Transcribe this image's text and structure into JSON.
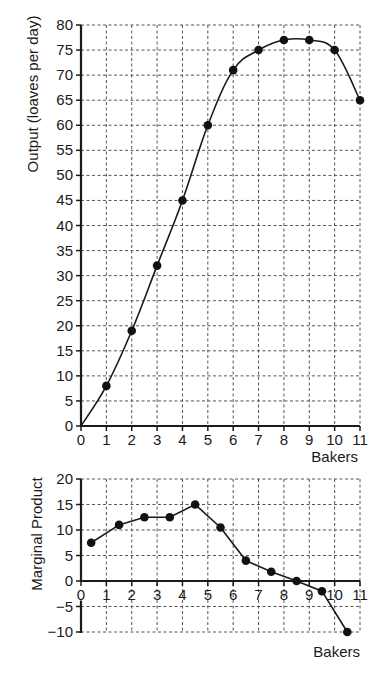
{
  "chart_data": [
    {
      "id": "total",
      "type": "line",
      "title": "",
      "xlabel": "Bakers",
      "ylabel": "Output (loaves per day)",
      "x": [
        0,
        1,
        2,
        3,
        4,
        5,
        6,
        7,
        8,
        9,
        10,
        11
      ],
      "series": [
        {
          "name": "Output",
          "values": [
            0,
            8,
            19,
            32,
            45,
            60,
            71,
            75,
            77,
            77,
            75,
            65
          ],
          "markers_from_index": 1
        }
      ],
      "xlim": [
        0,
        11
      ],
      "ylim": [
        0,
        80
      ],
      "xticks": [
        "0",
        "1",
        "2",
        "3",
        "4",
        "5",
        "6",
        "7",
        "8",
        "9",
        "10",
        "11"
      ],
      "yticks": [
        "0",
        "5",
        "10",
        "15",
        "20",
        "25",
        "30",
        "35",
        "40",
        "45",
        "50",
        "55",
        "60",
        "65",
        "70",
        "75",
        "80"
      ],
      "grid": true
    },
    {
      "id": "marginal",
      "type": "line",
      "title": "",
      "xlabel": "Bakers",
      "ylabel": "Marginal Product",
      "x": [
        0.4,
        1.5,
        2.5,
        3.5,
        4.5,
        5.5,
        6.5,
        7.5,
        8.5,
        9.5,
        10.5
      ],
      "series": [
        {
          "name": "Marginal Product",
          "values": [
            7.5,
            11,
            12.5,
            12.5,
            15,
            10.5,
            4,
            1.8,
            0,
            -2,
            -10
          ]
        }
      ],
      "xlim": [
        0,
        11
      ],
      "ylim": [
        -10,
        20
      ],
      "xticks": [
        "0",
        "1",
        "2",
        "3",
        "4",
        "5",
        "6",
        "7",
        "8",
        "9",
        "10",
        "11"
      ],
      "yticks": [
        "−10",
        "−5",
        "0",
        "5",
        "10",
        "15",
        "20"
      ],
      "ytick_values": [
        -10,
        -5,
        0,
        5,
        10,
        15,
        20
      ],
      "grid": true
    }
  ]
}
